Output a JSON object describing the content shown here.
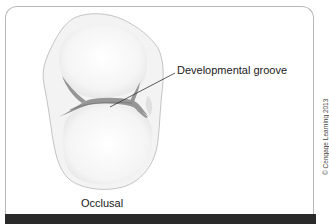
{
  "figure": {
    "view_label": "Occlusal",
    "callouts": [
      {
        "label": "Developmental groove",
        "target": "central groove"
      }
    ],
    "copyright": "© Cengage Learning 2013"
  },
  "colors": {
    "frame_border": "#b8b8b8",
    "bottom_bar": "#2a2a2a",
    "tooth_fill": "#f4f4f4",
    "tooth_outline": "#bdbdbd",
    "groove_shade": "#8c8c8c",
    "leader_line": "#333333",
    "text": "#1a1a1a"
  }
}
